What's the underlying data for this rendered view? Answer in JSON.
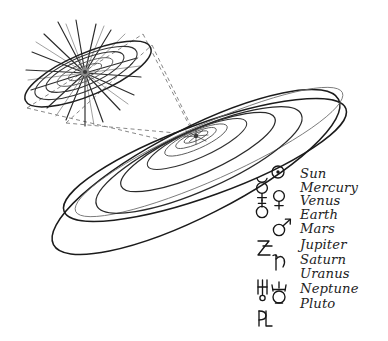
{
  "figure": {
    "style": "hand-drawn ink illustration",
    "background_color": "#ffffff",
    "ink_color": "#1b1b1b"
  },
  "main_diagram": {
    "name": "solar-system-orbits",
    "center_label": "Sun",
    "orbit_count": 9,
    "description": "Nested tilted elliptical planetary orbits seen in oblique perspective"
  },
  "inset": {
    "name": "inner-solar-system-detail",
    "description": "Magnified view of the inner planets around the radiating Sun",
    "ray_count": 22,
    "orbit_count": 5
  },
  "connector": {
    "name": "magnification-connector",
    "style": "dashed"
  },
  "legend": {
    "title": "Planetary symbols",
    "rows": [
      {
        "symbol_name": "sun-symbol",
        "label": "Sun",
        "column": "right"
      },
      {
        "symbol_name": "mercury-symbol",
        "label": "Mercury",
        "column": "left"
      },
      {
        "symbol_name": "venus-symbol",
        "label": "Venus",
        "column": "right"
      },
      {
        "symbol_name": "earth-symbol",
        "label": "Earth",
        "column": "left"
      },
      {
        "symbol_name": "mars-symbol",
        "label": "Mars",
        "column": "right"
      },
      {
        "symbol_name": "jupiter-symbol",
        "label": "Jupiter",
        "column": "left"
      },
      {
        "symbol_name": "saturn-symbol",
        "label": "Saturn",
        "column": "right"
      },
      {
        "symbol_name": "uranus-symbol",
        "label": "Uranus",
        "column": "left"
      },
      {
        "symbol_name": "neptune-symbol",
        "label": "Neptune",
        "column": "right"
      },
      {
        "symbol_name": "pluto-symbol",
        "label": "Pluto",
        "column": "left"
      }
    ]
  }
}
